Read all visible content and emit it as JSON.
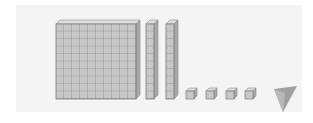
{
  "figure": {
    "blocks": {
      "hundreds": 1,
      "tens": 2,
      "ones": 4
    },
    "represented_value": 124,
    "colors": {
      "panel": "#f4f4f4",
      "block_face": "#c8c8c8",
      "block_top": "#dedede",
      "block_side": "#a9a9a9",
      "grid_line": "#7a7a7a",
      "fold": "#9a9a9a"
    }
  }
}
